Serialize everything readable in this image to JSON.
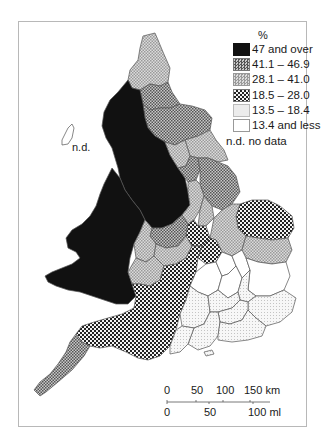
{
  "map": {
    "unit_label": "%",
    "legend": [
      {
        "label": "47 and over",
        "fill": "black"
      },
      {
        "label": "41.1 – 46.9",
        "fill": "dense-crosshatch"
      },
      {
        "label": "28.1 – 41.0",
        "fill": "light-crosshatch"
      },
      {
        "label": "18.5 – 28.0",
        "fill": "large-dots"
      },
      {
        "label": "13.5 – 18.4",
        "fill": "fine-dots"
      },
      {
        "label": "13.4 and less",
        "fill": "white"
      }
    ],
    "no_data_label": "n.d. no data",
    "island_label": "n.d.",
    "scale_bar": {
      "km_ticks": [
        "0",
        "50",
        "100",
        "150 km"
      ],
      "ml_ticks": [
        "0",
        "50",
        "100 ml"
      ]
    },
    "colors": {
      "black": "#111111",
      "dense_crosshatch": "#8a8a8a",
      "light_crosshatch": "#bdbdbd",
      "large_dots": "#6e6e6e",
      "fine_dots": "#e2e2e2",
      "white": "#ffffff",
      "border": "#555555"
    }
  }
}
